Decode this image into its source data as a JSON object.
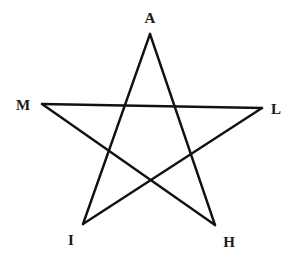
{
  "diagram": {
    "type": "pentagram",
    "stroke_color": "#111111",
    "background": "#ffffff",
    "vertices": [
      {
        "id": "A",
        "label": "A",
        "x": 150,
        "y": 34,
        "label_x": 150,
        "label_y": 23
      },
      {
        "id": "M",
        "label": "M",
        "x": 42,
        "y": 104,
        "label_x": 23,
        "label_y": 110
      },
      {
        "id": "L",
        "label": "L",
        "x": 262,
        "y": 108,
        "label_x": 276,
        "label_y": 114
      },
      {
        "id": "I",
        "label": "I",
        "x": 83,
        "y": 224,
        "label_x": 71,
        "label_y": 245
      },
      {
        "id": "H",
        "label": "H",
        "x": 215,
        "y": 225,
        "label_x": 229,
        "label_y": 247
      }
    ],
    "edges": [
      {
        "from": "A",
        "to": "I"
      },
      {
        "from": "I",
        "to": "L"
      },
      {
        "from": "L",
        "to": "M"
      },
      {
        "from": "M",
        "to": "H"
      },
      {
        "from": "H",
        "to": "A"
      }
    ]
  }
}
